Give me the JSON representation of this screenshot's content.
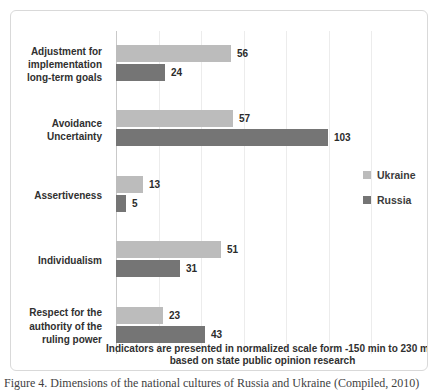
{
  "chart_data": {
    "type": "bar",
    "orientation": "horizontal",
    "title": "",
    "categories": [
      "Adjustment for implementation long-term goals",
      "Avoidance Uncertainty",
      "Assertiveness",
      "Individualism",
      "Respect for the authority of the ruling power"
    ],
    "series": [
      {
        "name": "Ukraine",
        "color": "#bcbcbc",
        "values": [
          56,
          57,
          13,
          51,
          23
        ]
      },
      {
        "name": "Russia",
        "color": "#757575",
        "values": [
          24,
          103,
          5,
          31,
          43
        ]
      }
    ],
    "value_axis": {
      "min": 0,
      "max": 150,
      "gridline_step": 20,
      "grid": true,
      "tick_labels_shown": false
    },
    "legend_position": "right",
    "note_line1": "Indicators are presented in normalized scale form -150 min to 230 max",
    "note_line2": "based on state public opinion research"
  },
  "caption": "Figure 4. Dimensions of the national cultures of Russia and Ukraine (Compiled, 2010)"
}
